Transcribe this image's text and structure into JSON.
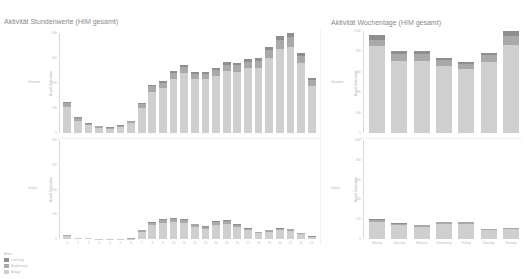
{
  "colors": {
    "base": "#cfcfcf",
    "mid": "#a9a9a9",
    "top": "#8e8e8e",
    "axis": "#d8d8d8"
  },
  "charts": {
    "hours": {
      "title": "Aktivität Stundenwerte (HIM gesamt)",
      "top_row_label": "Gesamt",
      "bottom_row_label": "Intern",
      "y_axis_title": "Anzahl Datensätze"
    },
    "weekdays": {
      "title": "Aktivität Wochentage (HIM gesamt)",
      "top_row_label": "Gesamt",
      "bottom_row_label": "Intern",
      "y_axis_title": "Anzahl Datensätze"
    }
  },
  "legend": {
    "title": "Aktion",
    "items": [
      {
        "label": "Löschung",
        "color": "#8e8e8e"
      },
      {
        "label": "Bearbeitung",
        "color": "#a9a9a9"
      },
      {
        "label": "Anlage",
        "color": "#cfcfcf"
      }
    ]
  },
  "chart_data": [
    {
      "type": "bar",
      "stacked": true,
      "title": "Aktivität Stundenwerte (HIM gesamt)",
      "panel": "Gesamt",
      "xlabel": "Stunde",
      "ylabel": "Anzahl Datensätze",
      "ylim": [
        0,
        400
      ],
      "yticks": [
        0,
        100,
        200,
        300,
        400
      ],
      "categories": [
        "0",
        "1",
        "2",
        "3",
        "4",
        "5",
        "6",
        "7",
        "8",
        "9",
        "10",
        "11",
        "12",
        "13",
        "14",
        "15",
        "16",
        "17",
        "18",
        "19",
        "20",
        "21",
        "22",
        "23"
      ],
      "series": [
        {
          "name": "Anlage",
          "values": [
            105,
            50,
            32,
            22,
            18,
            24,
            40,
            100,
            165,
            180,
            215,
            240,
            215,
            215,
            230,
            250,
            245,
            260,
            262,
            300,
            335,
            345,
            280,
            190
          ]
        },
        {
          "name": "Bearbeitung",
          "values": [
            15,
            10,
            6,
            5,
            4,
            5,
            7,
            15,
            22,
            22,
            25,
            25,
            22,
            22,
            24,
            24,
            26,
            26,
            27,
            32,
            38,
            40,
            30,
            22
          ]
        },
        {
          "name": "Löschung",
          "values": [
            6,
            3,
            2,
            2,
            1,
            2,
            3,
            5,
            7,
            8,
            8,
            9,
            8,
            8,
            8,
            9,
            9,
            10,
            10,
            12,
            15,
            15,
            12,
            8
          ]
        }
      ]
    },
    {
      "type": "bar",
      "stacked": true,
      "title": "Aktivität Stundenwerte (HIM gesamt)",
      "panel": "Intern",
      "xlabel": "Stunde",
      "ylabel": "Anzahl Datensätze",
      "ylim": [
        0,
        400
      ],
      "yticks": [
        0,
        100,
        200,
        300,
        400
      ],
      "categories": [
        "0",
        "1",
        "2",
        "3",
        "4",
        "5",
        "6",
        "7",
        "8",
        "9",
        "10",
        "11",
        "12",
        "13",
        "14",
        "15",
        "16",
        "17",
        "18",
        "19",
        "20",
        "21",
        "22",
        "23"
      ],
      "series": [
        {
          "name": "Anlage",
          "values": [
            14,
            5,
            3,
            1,
            1,
            1,
            2,
            30,
            55,
            65,
            68,
            65,
            50,
            42,
            58,
            62,
            48,
            35,
            24,
            30,
            35,
            32,
            20,
            8
          ]
        },
        {
          "name": "Bearbeitung",
          "values": [
            3,
            1,
            1,
            0,
            0,
            0,
            1,
            6,
            10,
            12,
            12,
            12,
            9,
            8,
            10,
            12,
            9,
            7,
            4,
            6,
            7,
            7,
            4,
            2
          ]
        },
        {
          "name": "Löschung",
          "values": [
            1,
            0,
            0,
            0,
            0,
            0,
            0,
            2,
            3,
            4,
            5,
            4,
            3,
            2,
            3,
            4,
            3,
            2,
            1,
            2,
            3,
            2,
            1,
            1
          ]
        }
      ]
    },
    {
      "type": "bar",
      "stacked": true,
      "title": "Aktivität Wochentage (HIM gesamt)",
      "panel": "Gesamt",
      "xlabel": "Wochentag",
      "ylabel": "Anzahl Datensätze",
      "ylim": [
        0,
        1000
      ],
      "yticks": [
        0,
        200,
        400,
        600,
        800,
        1000
      ],
      "categories": [
        "Montag",
        "Dienstag",
        "Mittwoch",
        "Donnerstag",
        "Freitag",
        "Samstag",
        "Sonntag"
      ],
      "series": [
        {
          "name": "Anlage",
          "values": [
            855,
            710,
            710,
            660,
            625,
            695,
            860
          ]
        },
        {
          "name": "Bearbeitung",
          "values": [
            60,
            65,
            65,
            58,
            55,
            65,
            95
          ]
        },
        {
          "name": "Löschung",
          "values": [
            45,
            25,
            25,
            22,
            20,
            25,
            45
          ]
        }
      ]
    },
    {
      "type": "bar",
      "stacked": true,
      "title": "Aktivität Wochentage (HIM gesamt)",
      "panel": "Intern",
      "xlabel": "Wochentag",
      "ylabel": "Anzahl Datensätze",
      "ylim": [
        0,
        1000
      ],
      "yticks": [
        0,
        200,
        400,
        600,
        800,
        1000
      ],
      "categories": [
        "Montag",
        "Dienstag",
        "Mittwoch",
        "Donnerstag",
        "Freitag",
        "Samstag",
        "Sonntag"
      ],
      "series": [
        {
          "name": "Anlage",
          "values": [
            175,
            140,
            125,
            150,
            150,
            90,
            100
          ]
        },
        {
          "name": "Bearbeitung",
          "values": [
            20,
            15,
            12,
            18,
            18,
            8,
            8
          ]
        },
        {
          "name": "Löschung",
          "values": [
            8,
            5,
            5,
            7,
            7,
            3,
            3
          ]
        }
      ]
    }
  ]
}
